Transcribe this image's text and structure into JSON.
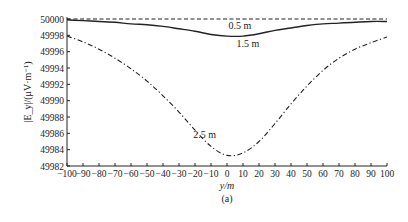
{
  "chart_data": {
    "type": "line",
    "title": "",
    "panel_label": "(a)",
    "xlabel": "y/m",
    "ylabel": "|E_y|/(μV·m⁻¹)",
    "xlim": [
      -100,
      100
    ],
    "ylim": [
      49982,
      50000
    ],
    "grid": false,
    "legend": "inline curve labels",
    "x_ticks": [
      -100,
      -90,
      -80,
      -70,
      -60,
      -50,
      -40,
      -30,
      -20,
      -10,
      0,
      10,
      20,
      30,
      40,
      50,
      60,
      70,
      80,
      90,
      100
    ],
    "y_ticks": [
      49982,
      49984,
      49986,
      49988,
      49990,
      49992,
      49994,
      49996,
      49998,
      50000
    ],
    "x": [
      -100,
      -90,
      -80,
      -70,
      -60,
      -50,
      -40,
      -30,
      -20,
      -10,
      0,
      10,
      20,
      30,
      40,
      50,
      60,
      70,
      80,
      90,
      100
    ],
    "series": [
      {
        "name": "0.5 m",
        "style": "dashed",
        "values": [
          50000,
          50000,
          50000,
          50000,
          50000,
          50000,
          50000,
          50000,
          50000,
          50000,
          50000,
          50000,
          50000,
          50000,
          50000,
          50000,
          50000,
          50000,
          50000,
          50000,
          50000
        ]
      },
      {
        "name": "1.5 m",
        "style": "solid",
        "values": [
          49999.9,
          49999.8,
          49999.7,
          49999.6,
          49999.4,
          49999.3,
          49999.1,
          49998.8,
          49998.5,
          49998.1,
          49997.9,
          49997.9,
          49998.2,
          49998.6,
          49998.9,
          49999.2,
          49999.4,
          49999.5,
          49999.6,
          49999.7,
          49999.7
        ]
      },
      {
        "name": "2.5 m",
        "style": "dash-dot",
        "values": [
          49997.9,
          49997.2,
          49996.3,
          49995.2,
          49993.9,
          49992.4,
          49990.6,
          49988.6,
          49986.4,
          49984.4,
          49983.3,
          49983.6,
          49985.0,
          49987.2,
          49989.6,
          49991.8,
          49993.7,
          49995.2,
          49996.3,
          49997.1,
          49997.8
        ]
      }
    ],
    "annotations": [
      {
        "text": "0.5 m",
        "x": 8,
        "y": 49999.2
      },
      {
        "text": "1.5 m",
        "x": 13,
        "y": 49997.0
      },
      {
        "text": "2.5 m",
        "x": -14,
        "y": 49985.8
      }
    ]
  }
}
